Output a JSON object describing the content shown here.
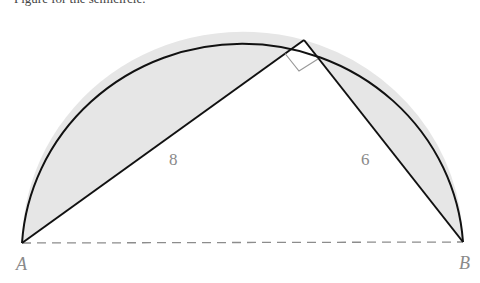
{
  "caption": "Figure for the semicircle.",
  "diagram": {
    "type": "semicircle-inscribed-right-triangle",
    "points": {
      "A": {
        "label": "A",
        "x": 22,
        "y": 243
      },
      "B": {
        "label": "B",
        "x": 463,
        "y": 242
      },
      "C": {
        "label": "",
        "x": 304,
        "y": 40
      }
    },
    "sides": {
      "AC": {
        "label": "8"
      },
      "BC": {
        "label": "6"
      }
    },
    "right_angle_at": "C",
    "diameter_style": "dashed",
    "shaded_regions": "circular segments between chords AC, BC and the arc",
    "colors": {
      "stroke": "#111111",
      "shade": "#e6e6e6",
      "dash": "#8c8c8c",
      "label": "#8a8a8a"
    }
  }
}
